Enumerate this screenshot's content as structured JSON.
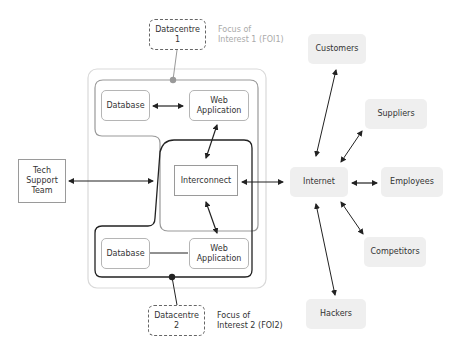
{
  "nodes": {
    "datacentre1": "Datacentre\n1",
    "datacentre2": "Datacentre\n2",
    "database_top": "Database",
    "webapp_top": "Web\nApplication",
    "interconnect": "Interconnect",
    "database_bottom": "Database",
    "webapp_bottom": "Web\nApplication",
    "tech_support": "Tech\nSupport\nTeam",
    "internet": "Internet",
    "customers": "Customers",
    "suppliers": "Suppliers",
    "employees": "Employees",
    "competitors": "Competitors",
    "hackers": "Hackers"
  },
  "labels": {
    "foi1": "Focus of\nInterest 1 (FOI1)",
    "foi2": "Focus of\nInterest 2 (FOI2)"
  },
  "colors": {
    "foi1_line": "#999999",
    "foi2_line": "#222222",
    "outer_container": "#d9d9d9",
    "stakeholder_fill": "#efefef"
  }
}
